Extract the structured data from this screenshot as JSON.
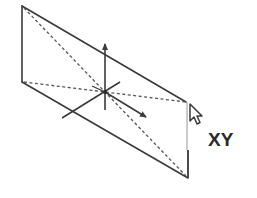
{
  "diagram": {
    "plane_label": "XY",
    "colors": {
      "line": "#3a3a3a",
      "dashed": "#555555",
      "thin_edge": "#8a8a8a",
      "background": "#ffffff"
    },
    "plane": {
      "corners": {
        "top_left": [
          22,
          6
        ],
        "bottom_left": [
          22,
          82
        ],
        "top_right": [
          186,
          102
        ],
        "bottom_right": [
          188,
          178
        ]
      }
    },
    "axes": {
      "origin": [
        105,
        92
      ],
      "z_axis": {
        "from": [
          105,
          110
        ],
        "to": [
          105,
          42
        ],
        "arrow": true
      },
      "x_axis": {
        "from": [
          105,
          92
        ],
        "to": [
          148,
          118
        ],
        "arrow": true
      },
      "y_axis": {
        "from": [
          62,
          118
        ],
        "to": [
          120,
          82
        ],
        "arrow": false
      }
    },
    "cursor": {
      "icon": "mouse-pointer-arrow-icon",
      "position": [
        190,
        105
      ]
    }
  }
}
